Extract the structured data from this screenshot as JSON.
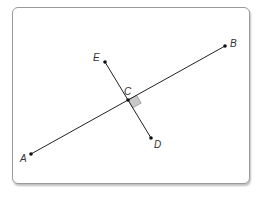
{
  "diagram": {
    "type": "geometry",
    "points": {
      "A": {
        "label": "A",
        "x": 31,
        "y": 154
      },
      "B": {
        "label": "B",
        "x": 225,
        "y": 46
      },
      "C": {
        "label": "C",
        "x": 128,
        "y": 100
      },
      "D": {
        "label": "D",
        "x": 151,
        "y": 138
      },
      "E": {
        "label": "E",
        "x": 105,
        "y": 62
      }
    },
    "segments": [
      {
        "from": "A",
        "to": "B"
      },
      {
        "from": "E",
        "to": "D"
      }
    ],
    "right_angle_marker": {
      "at": "C",
      "fill": "#c8c8c8"
    },
    "colors": {
      "line": "#222222",
      "point": "#111111",
      "frame_border": "#9a9a9a"
    }
  }
}
